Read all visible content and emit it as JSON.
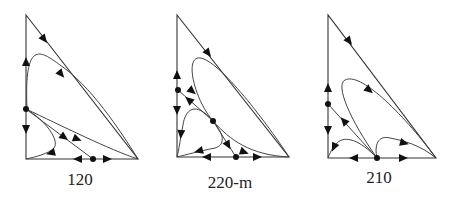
{
  "figure": {
    "panels": [
      {
        "label": "120"
      },
      {
        "label": "220-m"
      },
      {
        "label": "210"
      }
    ],
    "colors": {
      "line": "#333333",
      "marker": "#111111",
      "background": "#ffffff"
    }
  }
}
